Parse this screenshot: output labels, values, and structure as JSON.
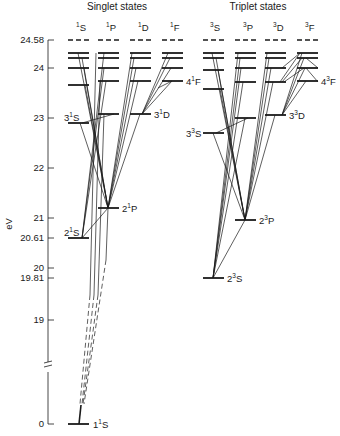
{
  "diagram": {
    "title_singlet": "Singlet states",
    "title_triplet": "Triplet states",
    "y_axis_label": "eV",
    "y_ticks": [
      {
        "label": "24.58",
        "value": 24.58,
        "y": 40
      },
      {
        "label": "24",
        "value": 24,
        "y": 68
      },
      {
        "label": "23",
        "value": 23,
        "y": 118
      },
      {
        "label": "22",
        "value": 22,
        "y": 168
      },
      {
        "label": "21",
        "value": 21,
        "y": 218
      },
      {
        "label": "20.61",
        "value": 20.61,
        "y": 238
      },
      {
        "label": "20",
        "value": 20,
        "y": 268
      },
      {
        "label": "19.81",
        "value": 19.81,
        "y": 278
      },
      {
        "label": "19",
        "value": 19,
        "y": 320
      },
      {
        "label": "0",
        "value": 0,
        "y": 424
      }
    ],
    "columns": [
      {
        "id": "1S",
        "mult": "1",
        "L": "S",
        "x": 78
      },
      {
        "id": "1P",
        "mult": "1",
        "L": "P",
        "x": 108
      },
      {
        "id": "1D",
        "mult": "1",
        "L": "D",
        "x": 140
      },
      {
        "id": "1F",
        "mult": "1",
        "L": "F",
        "x": 172
      },
      {
        "id": "3S",
        "mult": "3",
        "L": "S",
        "x": 213
      },
      {
        "id": "3P",
        "mult": "3",
        "L": "P",
        "x": 245
      },
      {
        "id": "3D",
        "mult": "3",
        "L": "D",
        "x": 275
      },
      {
        "id": "3F",
        "mult": "3",
        "L": "F",
        "x": 307
      }
    ],
    "level_labels": [
      {
        "n": "1",
        "mult": "1",
        "L": "S",
        "text": "1¹S"
      },
      {
        "n": "2",
        "mult": "1",
        "L": "S",
        "text": "2¹S"
      },
      {
        "n": "3",
        "mult": "1",
        "L": "S",
        "text": "3¹S"
      },
      {
        "n": "2",
        "mult": "1",
        "L": "P",
        "text": "2¹P"
      },
      {
        "n": "3",
        "mult": "1",
        "L": "D",
        "text": "3¹D"
      },
      {
        "n": "4",
        "mult": "1",
        "L": "F",
        "text": "4¹F"
      },
      {
        "n": "2",
        "mult": "3",
        "L": "S",
        "text": "2³S"
      },
      {
        "n": "3",
        "mult": "3",
        "L": "S",
        "text": "3³S"
      },
      {
        "n": "2",
        "mult": "3",
        "L": "P",
        "text": "2³P"
      },
      {
        "n": "3",
        "mult": "3",
        "L": "D",
        "text": "3³D"
      },
      {
        "n": "4",
        "mult": "3",
        "L": "F",
        "text": "4³F"
      }
    ],
    "ionization_limit_eV": 24.58,
    "colors": {
      "ink": "#1a1a1a",
      "background": "#ffffff"
    }
  }
}
